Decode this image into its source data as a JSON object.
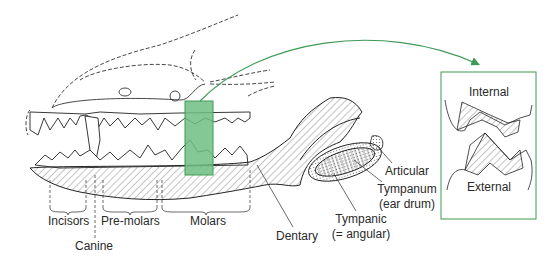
{
  "figure": {
    "colors": {
      "highlight": "#3f9a55",
      "highlight_fill": "#6fbf82",
      "line": "#222222",
      "frame": "#3f9a55"
    }
  },
  "labels": {
    "incisors": "Incisors",
    "canine": "Canine",
    "premolars": "Pre-molars",
    "molars": "Molars",
    "dentary": "Dentary",
    "tympanic": "Tympanic",
    "tympanic_alt": "(= angular)",
    "articular": "Articular",
    "tympanum": "Tympanum",
    "tympanum_alt": "(ear drum)"
  },
  "inset": {
    "top_label": "Internal",
    "bottom_label": "External"
  }
}
